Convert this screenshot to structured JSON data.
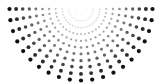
{
  "figure": {
    "width": 163,
    "height": 84,
    "background_color": "#ffffff",
    "dot_color": "#111111"
  },
  "chart_data": {
    "type": "scatter",
    "title": "",
    "subtitle": "",
    "xlabel": "",
    "ylabel": "",
    "grid": false,
    "legend": null,
    "xlim": [
      0,
      163
    ],
    "ylim": [
      0,
      84
    ],
    "geometry": {
      "origin_x": 81,
      "origin_y": 9,
      "ray_count": 21,
      "angle_start_deg": 0,
      "angle_end_deg": 180,
      "rings": 11,
      "ring_spacing": 6.6,
      "ring_start_radius": 5.5,
      "min_dot_radius": 0.35,
      "max_dot_radius": 2.1,
      "min_opacity": 0.1,
      "max_opacity": 1.0,
      "clip_rect": [
        0,
        0,
        163,
        84
      ]
    }
  }
}
